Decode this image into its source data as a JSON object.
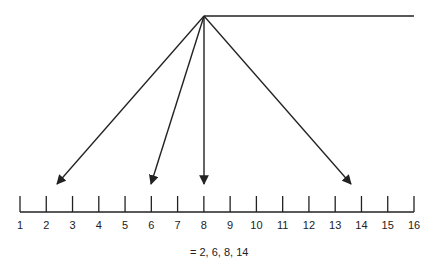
{
  "diagram": {
    "type": "number-line-mapping",
    "number_line": {
      "min": 1,
      "max": 16,
      "labels": [
        "1",
        "2",
        "3",
        "4",
        "5",
        "6",
        "7",
        "8",
        "9",
        "10",
        "11",
        "12",
        "13",
        "14",
        "15",
        "16"
      ]
    },
    "arrow_targets": [
      2.4,
      6,
      8,
      13.7
    ],
    "targets_label": "= 2, 6, 8, 14",
    "colors": {
      "line": "#222222",
      "text": "#222222",
      "background": "#ffffff"
    }
  }
}
